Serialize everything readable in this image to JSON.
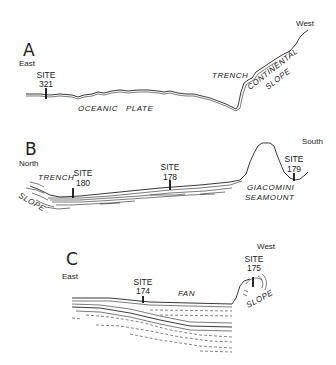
{
  "panels": [
    {
      "id": "A",
      "letter": "A",
      "left_direction": "East",
      "right_direction": "West",
      "sites": [
        {
          "label": "SITE",
          "number": "321"
        }
      ],
      "features": [
        "OCEANIC",
        "PLATE",
        "TRENCH",
        "CONTINENTAL",
        "SLOPE"
      ]
    },
    {
      "id": "B",
      "letter": "B",
      "left_direction": "North",
      "right_direction": "South",
      "sites": [
        {
          "label": "SITE",
          "number": "180"
        },
        {
          "label": "SITE",
          "number": "178"
        },
        {
          "label": "SITE",
          "number": "179"
        }
      ],
      "features": [
        "TRENCH",
        "SLOPE",
        "GIACOMINI",
        "SEAMOUNT"
      ]
    },
    {
      "id": "C",
      "letter": "C",
      "left_direction": "East",
      "right_direction": "West",
      "sites": [
        {
          "label": "SITE",
          "number": "174"
        },
        {
          "label": "SITE",
          "number": "175"
        }
      ],
      "features": [
        "FAN",
        "SLOPE"
      ]
    }
  ]
}
